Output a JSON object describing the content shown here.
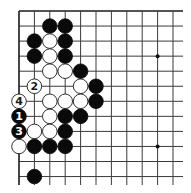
{
  "board": {
    "columns": 11,
    "rows": 12,
    "origin_x": 19,
    "origin_y": 11,
    "spacing_x": 15.4,
    "spacing_y": 15.05,
    "line_extend_right": 183,
    "line_extend_bottom": 185,
    "edges": [
      "top",
      "left"
    ],
    "stone_radius": 7.3,
    "star_points": [
      {
        "col": 9,
        "row": 3
      },
      {
        "col": 9,
        "row": 9
      }
    ]
  },
  "stones": [
    {
      "color": "black",
      "col": 2,
      "row": 1
    },
    {
      "color": "black",
      "col": 3,
      "row": 1
    },
    {
      "color": "black",
      "col": 1,
      "row": 2
    },
    {
      "color": "white",
      "col": 2,
      "row": 2
    },
    {
      "color": "black",
      "col": 3,
      "row": 2
    },
    {
      "color": "black",
      "col": 1,
      "row": 3
    },
    {
      "color": "white",
      "col": 2,
      "row": 3
    },
    {
      "color": "black",
      "col": 3,
      "row": 3
    },
    {
      "color": "white",
      "col": 2,
      "row": 4
    },
    {
      "color": "white",
      "col": 3,
      "row": 4
    },
    {
      "color": "black",
      "col": 4,
      "row": 4
    },
    {
      "color": "white",
      "col": 1,
      "row": 5,
      "label": "2"
    },
    {
      "color": "white",
      "col": 4,
      "row": 5
    },
    {
      "color": "black",
      "col": 5,
      "row": 5
    },
    {
      "color": "white",
      "col": 0,
      "row": 6,
      "label": "4"
    },
    {
      "color": "white",
      "col": 2,
      "row": 6
    },
    {
      "color": "white",
      "col": 3,
      "row": 6
    },
    {
      "color": "white",
      "col": 4,
      "row": 6
    },
    {
      "color": "black",
      "col": 5,
      "row": 6
    },
    {
      "color": "black",
      "col": 0,
      "row": 7,
      "label": "1"
    },
    {
      "color": "white",
      "col": 2,
      "row": 7
    },
    {
      "color": "black",
      "col": 3,
      "row": 7
    },
    {
      "color": "black",
      "col": 4,
      "row": 7
    },
    {
      "color": "black",
      "col": 0,
      "row": 8,
      "label": "3"
    },
    {
      "color": "white",
      "col": 1,
      "row": 8
    },
    {
      "color": "white",
      "col": 2,
      "row": 8
    },
    {
      "color": "black",
      "col": 3,
      "row": 8
    },
    {
      "color": "white",
      "col": 0,
      "row": 9
    },
    {
      "color": "black",
      "col": 1,
      "row": 9
    },
    {
      "color": "black",
      "col": 2,
      "row": 9
    },
    {
      "color": "black",
      "col": 3,
      "row": 9
    },
    {
      "color": "black",
      "col": 1,
      "row": 11
    }
  ],
  "move_labels": [
    "1",
    "2",
    "3",
    "4"
  ]
}
